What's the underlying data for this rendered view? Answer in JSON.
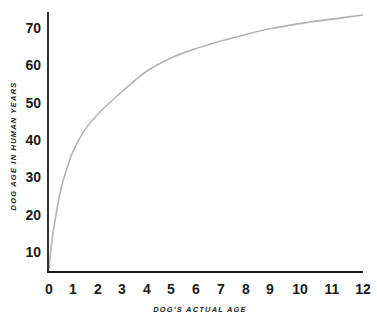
{
  "chart_data": {
    "type": "line",
    "title": "",
    "xlabel": "DOG'S ACTUAL AGE",
    "ylabel": "DOG AGE IN HUMAN YEARS",
    "x_ticks": [
      "0",
      "1",
      "2",
      "3",
      "4",
      "5",
      "6",
      "7",
      "8",
      "9",
      "10",
      "11",
      "12"
    ],
    "y_ticks": [
      "10",
      "20",
      "30",
      "40",
      "50",
      "60",
      "70"
    ],
    "xlim": [
      0,
      12
    ],
    "ylim": [
      5,
      75
    ],
    "grid": false,
    "legend": null,
    "series": [
      {
        "name": "Dog age in human years",
        "color": "#b3b3b3",
        "x": [
          0,
          0.1,
          0.25,
          0.5,
          0.75,
          1,
          1.5,
          2,
          3,
          4,
          5,
          6,
          7,
          8,
          9,
          10,
          11,
          12
        ],
        "y": [
          5.5,
          12,
          18.5,
          27,
          32.5,
          37,
          43,
          47,
          53,
          58.5,
          62,
          64.5,
          66.5,
          68.3,
          69.8,
          71.2,
          72.4,
          73.5
        ]
      }
    ]
  },
  "colors": {
    "axis": "#1a1a1a",
    "curve": "#b3b3b3",
    "background": "#ffffff"
  }
}
